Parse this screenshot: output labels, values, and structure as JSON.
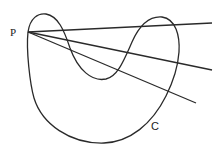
{
  "figure": {
    "labels": {
      "point": "P",
      "curve": "C"
    },
    "stroke_color": "#2a2a2a",
    "background": "#ffffff",
    "point_P": [
      28,
      32
    ],
    "curve_path": "M28,32 C30,18 38,13 46,14 C58,16 64,30 70,48 C78,70 92,82 106,79 C118,76 124,60 132,42 C140,24 150,16 162,17 C176,19 180,36 179,52 C178,66 173,82 166,96 C152,124 130,142 104,143 C70,144 42,124 34,98 C30,84 26,50 28,32 Z",
    "rays": [
      {
        "to": [
          212,
          23
        ]
      },
      {
        "to": [
          212,
          70
        ]
      },
      {
        "to": [
          196,
          103
        ]
      }
    ]
  }
}
